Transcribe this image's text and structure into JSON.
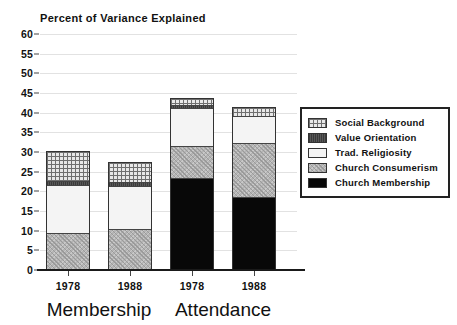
{
  "chart_data": {
    "type": "bar",
    "subtype": "stacked-bar",
    "title": "Percent of Variance Explained",
    "xlabel": "",
    "ylabel": "",
    "ylim": [
      0,
      60
    ],
    "ytick_step": 5,
    "yticks": [
      60,
      55,
      50,
      45,
      40,
      35,
      30,
      25,
      20,
      15,
      10,
      5,
      0
    ],
    "ytick_labels": [
      "60",
      "55",
      "50",
      "45",
      "40",
      "35",
      "30",
      "25",
      "20",
      "15",
      "10",
      "5",
      "0"
    ],
    "grid": true,
    "grid_axis": "y",
    "legend_position": "right",
    "categories": [
      "1978",
      "1988",
      "1978",
      "1988"
    ],
    "groups": [
      {
        "label": "Membership",
        "categories": [
          "1978",
          "1988"
        ]
      },
      {
        "label": "Attendance",
        "categories": [
          "1978",
          "1988"
        ]
      }
    ],
    "series": [
      {
        "name": "Church Membership",
        "values": [
          0.0,
          0.0,
          23.1,
          18.3
        ],
        "color": "#080808",
        "pattern": "solid-black"
      },
      {
        "name": "Church Consumerism",
        "values": [
          9.2,
          10.1,
          8.1,
          13.8
        ],
        "color": "#b4b4b4",
        "pattern": "stipple-gray"
      },
      {
        "name": "Trad. Religiosity",
        "values": [
          12.2,
          11.1,
          9.8,
          6.8
        ],
        "color": "#f4f4f4",
        "pattern": "white"
      },
      {
        "name": "Value Orientation",
        "values": [
          1.1,
          1.0,
          0.8,
          0.0
        ],
        "color": "#4a4a4a",
        "pattern": "dark-gray"
      },
      {
        "name": "Social Background",
        "values": [
          7.5,
          4.9,
          1.8,
          2.3
        ],
        "color": "#e8e8e8",
        "pattern": "crosshatch-grid"
      }
    ],
    "totals": [
      30.0,
      27.1,
      43.6,
      41.2
    ],
    "stack_order_bottom_to_top": [
      "Church Membership",
      "Church Consumerism",
      "Trad. Religiosity",
      "Value Orientation",
      "Social Background"
    ]
  },
  "legend": {
    "entries": [
      {
        "label": "Social Background",
        "swatch": "crosshatch-grid"
      },
      {
        "label": "Value Orientation",
        "swatch": "dark-gray"
      },
      {
        "label": "Trad. Religiosity",
        "swatch": "white"
      },
      {
        "label": "Church Consumerism",
        "swatch": "stipple-gray"
      },
      {
        "label": "Church Membership",
        "swatch": "solid-black"
      }
    ]
  },
  "colors": {
    "background": "#ffffff",
    "axis": "#1a1a1a",
    "grid": "#e2e2e2",
    "text": "#111111",
    "legend_border": "#222222"
  }
}
